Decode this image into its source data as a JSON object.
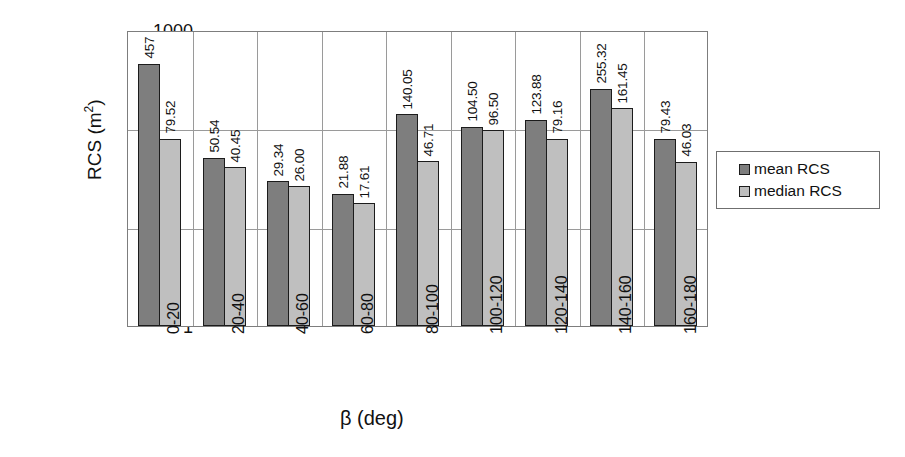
{
  "chart_data": {
    "type": "bar",
    "title": "",
    "subtitle": "",
    "xlabel": "β (deg)",
    "ylabel": "RCS (m²)",
    "ylabel_main": "RCS (m",
    "ylabel_sup": "2",
    "ylabel_tail": ")",
    "yscale": "log",
    "ylim": [
      1,
      1000
    ],
    "ytick_labels": [
      "1000",
      "100",
      "10",
      "1"
    ],
    "ytick_values": [
      1000,
      100,
      10,
      1
    ],
    "grid": "horizontal-and-category-dividers",
    "legend_position": "right",
    "categories": [
      "0-20",
      "20-40",
      "40-60",
      "60-80",
      "80-100",
      "100-120",
      "120-140",
      "140-160",
      "160-180"
    ],
    "series": [
      {
        "name": "mean RCS",
        "color": "#7e7e7e",
        "values": [
          457,
          50.54,
          29.34,
          21.88,
          140.05,
          104.5,
          123.88,
          255.32,
          79.43
        ],
        "labels": [
          "457",
          "50.54",
          "29.34",
          "21.88",
          "140.05",
          "104.50",
          "123.88",
          "255.32",
          "79.43"
        ]
      },
      {
        "name": "median RCS",
        "color": "#bfbfbf",
        "values": [
          79.52,
          40.45,
          26.0,
          17.61,
          46.71,
          96.5,
          79.16,
          161.45,
          46.03
        ],
        "labels": [
          "79.52",
          "40.45",
          "26.00",
          "17.61",
          "46.71",
          "96.50",
          "79.16",
          "161.45",
          "46.03"
        ]
      }
    ]
  },
  "legend": {
    "entries": [
      {
        "label": "mean RCS",
        "color": "#7e7e7e"
      },
      {
        "label": "median RCS",
        "color": "#bfbfbf"
      }
    ]
  },
  "colors": {
    "mean": "#7e7e7e",
    "median": "#bfbfbf",
    "axis": "#7d7d7d",
    "grid": "#9a9a9a",
    "bar_outline": "#1c1c1c",
    "text": "#111111",
    "background": "#ffffff"
  }
}
